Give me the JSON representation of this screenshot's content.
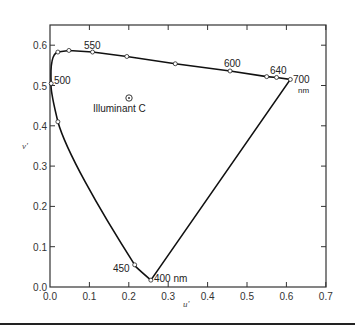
{
  "chart_data": {
    "type": "line",
    "title": "",
    "xlabel": "u'",
    "ylabel": "v'",
    "xlim": [
      0.0,
      0.7
    ],
    "ylim": [
      0.0,
      0.65
    ],
    "grid": false,
    "x_ticks": [
      "0.0",
      "0.1",
      "0.2",
      "0.3",
      "0.4",
      "0.5",
      "0.6",
      "0.7"
    ],
    "y_ticks": [
      "0.0",
      "0.1",
      "0.2",
      "0.3",
      "0.4",
      "0.5",
      "0.6"
    ],
    "series": [
      {
        "name": "spectrum locus",
        "points": [
          {
            "u": 0.256,
            "v": 0.017,
            "label": "400 nm"
          },
          {
            "u": 0.215,
            "v": 0.055,
            "label": "450"
          },
          {
            "u": 0.02,
            "v": 0.41,
            "label": ""
          },
          {
            "u": 0.003,
            "v": 0.505,
            "label": "500"
          },
          {
            "u": 0.02,
            "v": 0.583,
            "label": ""
          },
          {
            "u": 0.048,
            "v": 0.587,
            "label": ""
          },
          {
            "u": 0.108,
            "v": 0.583,
            "label": "550"
          },
          {
            "u": 0.195,
            "v": 0.572,
            "label": ""
          },
          {
            "u": 0.318,
            "v": 0.554,
            "label": ""
          },
          {
            "u": 0.457,
            "v": 0.536,
            "label": "600"
          },
          {
            "u": 0.55,
            "v": 0.522,
            "label": ""
          },
          {
            "u": 0.575,
            "v": 0.52,
            "label": "640"
          },
          {
            "u": 0.61,
            "v": 0.515,
            "label": "700 nm"
          }
        ]
      }
    ],
    "annotations": [
      {
        "text": "Illuminant C",
        "u": 0.2,
        "v": 0.47,
        "marker": "circle-dot"
      }
    ]
  },
  "labels": {
    "x_axis": "u'",
    "y_axis": "v'",
    "illuminant": "Illuminant C",
    "wl_400": "400 nm",
    "wl_450": "450",
    "wl_500": "500",
    "wl_550": "550",
    "wl_600": "600",
    "wl_640": "640",
    "wl_700": "700",
    "wl_700_unit": "nm"
  }
}
